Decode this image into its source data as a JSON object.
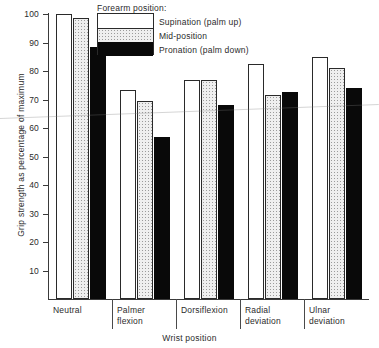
{
  "chart_data": {
    "type": "bar",
    "title": "",
    "xlabel": "Wrist position",
    "ylabel": "Grip strength as percentage of maximum",
    "ylim": [
      0,
      100
    ],
    "yticks": [
      10,
      20,
      30,
      40,
      50,
      60,
      70,
      80,
      90,
      100
    ],
    "grid": false,
    "legend_position": "top-center",
    "legend_title": "Forearm position:",
    "categories": [
      "Neutral",
      "Palmer flexion",
      "Dorsiflexion",
      "Radial deviation",
      "Ulnar deviation"
    ],
    "series": [
      {
        "name": "Supination (palm up)",
        "key": "supination",
        "color": "#ffffff",
        "values": [
          100,
          73.5,
          77,
          82.5,
          85
        ]
      },
      {
        "name": "Mid-position",
        "key": "mid",
        "color": "#efefef",
        "values": [
          98.5,
          69.5,
          77,
          71.5,
          81
        ]
      },
      {
        "name": "Pronation (palm down)",
        "key": "pronation",
        "color": "#090909",
        "values": [
          88.5,
          57,
          68,
          72.5,
          74
        ]
      }
    ]
  },
  "axis": {
    "y_tick_labels": [
      "100",
      "90",
      "80",
      "70",
      "60",
      "50",
      "40",
      "30",
      "20",
      "10"
    ],
    "y_title": "Grip strength as percentage of maximum",
    "x_title": "Wrist position"
  },
  "legend": {
    "title": "Forearm position:",
    "entries": [
      {
        "label": "Supination (palm up)"
      },
      {
        "label": "Mid-position"
      },
      {
        "label": "Pronation (palm down)"
      }
    ]
  },
  "categories": [
    {
      "line1": "Neutral",
      "line2": ""
    },
    {
      "line1": "Palmer",
      "line2": "flexion"
    },
    {
      "line1": "Dorsiflexion",
      "line2": ""
    },
    {
      "line1": "Radial",
      "line2": "deviation"
    },
    {
      "line1": "Ulnar",
      "line2": "deviation"
    }
  ]
}
